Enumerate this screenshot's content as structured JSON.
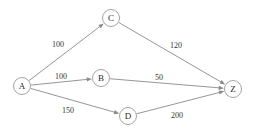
{
  "diagram": {
    "type": "directed-weighted-graph",
    "background_color": "#ffffff",
    "edge_color": "#8a8a8a",
    "node_stroke_color": "#9a9a9a",
    "node_fill_color": "#ffffff",
    "label_color": "#2b2b2b",
    "nodes": [
      {
        "id": "A",
        "label": "A",
        "cx": 22,
        "cy": 86,
        "r": 8.5
      },
      {
        "id": "B",
        "label": "B",
        "cx": 101,
        "cy": 78,
        "r": 8.5
      },
      {
        "id": "C",
        "label": "C",
        "cx": 111,
        "cy": 18,
        "r": 8.5
      },
      {
        "id": "D",
        "label": "D",
        "cx": 128,
        "cy": 116,
        "r": 8.5
      },
      {
        "id": "Z",
        "label": "Z",
        "cx": 233,
        "cy": 89,
        "r": 8.5
      }
    ],
    "edges": [
      {
        "id": "A-C",
        "from": "A",
        "to": "C",
        "weight": "100",
        "label_x": 58,
        "label_y": 44
      },
      {
        "id": "C-Z",
        "from": "C",
        "to": "Z",
        "weight": "120",
        "label_x": 176,
        "label_y": 45
      },
      {
        "id": "A-B",
        "from": "A",
        "to": "B",
        "weight": "100",
        "label_x": 61,
        "label_y": 76
      },
      {
        "id": "B-Z",
        "from": "B",
        "to": "Z",
        "weight": "50",
        "label_x": 159,
        "label_y": 77
      },
      {
        "id": "A-D",
        "from": "A",
        "to": "D",
        "weight": "150",
        "label_x": 68,
        "label_y": 110
      },
      {
        "id": "D-Z",
        "from": "D",
        "to": "Z",
        "weight": "200",
        "label_x": 177,
        "label_y": 115
      }
    ]
  }
}
